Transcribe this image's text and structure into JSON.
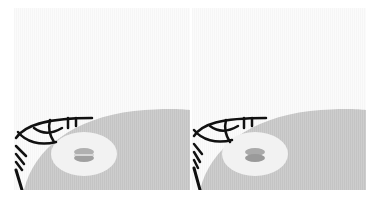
{
  "panels": [
    {
      "id": "left",
      "x": 14,
      "y": 8,
      "width": 176,
      "height": 182,
      "background_color": "#f8f8f8",
      "shape_color": "#c8c8c8",
      "ellipse_color": "#f3f3f3",
      "capsule_color": "#a9a9a9",
      "web_color": "#111111"
    },
    {
      "id": "right",
      "x": 192,
      "y": 8,
      "width": 174,
      "height": 182,
      "background_color": "#f8f8f8",
      "shape_color": "#c8c8c8",
      "ellipse_color": "#f3f3f3",
      "capsule_color": "#a3a3a3",
      "web_color": "#111111"
    }
  ]
}
